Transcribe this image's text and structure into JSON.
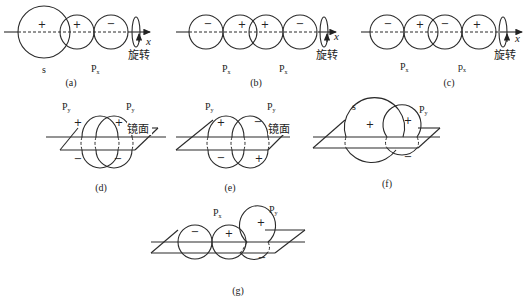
{
  "figure": {
    "panels": [
      {
        "id": "a",
        "caption": "(a)",
        "orbitals": [
          "s",
          "Px"
        ],
        "signs": [
          "+",
          "+",
          "−"
        ],
        "axis_label": "x",
        "rotation_label": "旋转"
      },
      {
        "id": "b",
        "caption": "(b)",
        "orbitals": [
          "Px",
          "Px"
        ],
        "signs": [
          "−",
          "+",
          "+",
          "−"
        ],
        "axis_label": "x",
        "rotation_label": "旋转"
      },
      {
        "id": "c",
        "caption": "(c)",
        "orbitals": [
          "Px",
          "px"
        ],
        "signs": [
          "−",
          "+",
          "−",
          "+"
        ],
        "axis_label": "x",
        "rotation_label": "旋转"
      },
      {
        "id": "d",
        "caption": "(d)",
        "orbitals": [
          "Py",
          "Py"
        ],
        "signs": [
          "+",
          "+",
          "−",
          "−"
        ],
        "plane_label": "镜面"
      },
      {
        "id": "e",
        "caption": "(e)",
        "orbitals": [
          "Py",
          "Py"
        ],
        "signs": [
          "+",
          "−",
          "−",
          "+"
        ],
        "plane_label": "镜面"
      },
      {
        "id": "f",
        "caption": "(f)",
        "orbitals": [
          "s",
          "Py"
        ],
        "signs": [
          "+",
          "+",
          "−"
        ]
      },
      {
        "id": "g",
        "caption": "(g)",
        "orbitals": [
          "Px",
          "Py"
        ],
        "signs": [
          "−",
          "+",
          "+",
          "−"
        ]
      }
    ]
  },
  "labels": {
    "s": "s",
    "P": "P",
    "p": "p",
    "sub_x": "x",
    "sub_y": "y",
    "plus": "+",
    "minus": "−",
    "x": "x",
    "rotate": "旋转",
    "mirror": "镜面",
    "cap_a": "(a)",
    "cap_b": "(b)",
    "cap_c": "(c)",
    "cap_d": "(d)",
    "cap_e": "(e)",
    "cap_f": "(f)",
    "cap_g": "(g)"
  }
}
